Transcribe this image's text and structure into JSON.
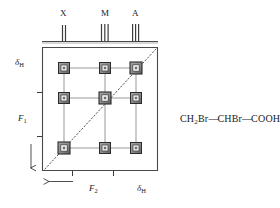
{
  "figure": {
    "type": "nmr-2d-cosy-schematic",
    "background_color": "#ffffff",
    "line_color": "#4a4a4a",
    "peak_fill_color": "#8c8c8c",
    "peak_stroke_color": "#2b2b2b",
    "diagonal_style": "dotted"
  },
  "top_spectrum": {
    "baseline_label": "1D proton spectrum trace",
    "multiplets": [
      {
        "label": "X",
        "x": 64,
        "lines": 2,
        "description": "doublet"
      },
      {
        "label": "M",
        "x": 105,
        "lines": 3,
        "description": "triplet/multiplet"
      },
      {
        "label": "A",
        "x": 136,
        "lines": 3,
        "description": "triplet/multiplet"
      }
    ]
  },
  "axes": {
    "vertical": {
      "top_label": "δ",
      "top_label_sub": "H",
      "dimension_label": "F",
      "dimension_label_sub": "1",
      "arrow_direction": "down",
      "ticks": 2
    },
    "horizontal": {
      "right_label": "δ",
      "right_label_sub": "H",
      "dimension_label": "F",
      "dimension_label_sub": "2",
      "arrow_direction": "left",
      "ticks": 2
    }
  },
  "contour_map": {
    "frequencies_f2": [
      64,
      105,
      136
    ],
    "frequencies_f1": [
      68,
      98,
      148
    ],
    "peaks": [
      {
        "f2": 64,
        "f1": 68,
        "kind": "cross"
      },
      {
        "f2": 105,
        "f1": 68,
        "kind": "cross"
      },
      {
        "f2": 136,
        "f1": 68,
        "kind": "diagonal"
      },
      {
        "f2": 64,
        "f1": 98,
        "kind": "cross"
      },
      {
        "f2": 105,
        "f1": 98,
        "kind": "diagonal"
      },
      {
        "f2": 136,
        "f1": 98,
        "kind": "cross"
      },
      {
        "f2": 64,
        "f1": 148,
        "kind": "diagonal"
      },
      {
        "f2": 105,
        "f1": 148,
        "kind": "cross"
      },
      {
        "f2": 136,
        "f1": 148,
        "kind": "cross"
      }
    ]
  },
  "molecule": {
    "formula_parts": [
      {
        "text": "CH",
        "sub": "2"
      },
      {
        "text": "Br"
      },
      {
        "bond": "—"
      },
      {
        "text": "CHBr"
      },
      {
        "bond": "—"
      },
      {
        "text": "COOH"
      }
    ],
    "formula_plain": "CH2Br—CHBr—COOH"
  }
}
